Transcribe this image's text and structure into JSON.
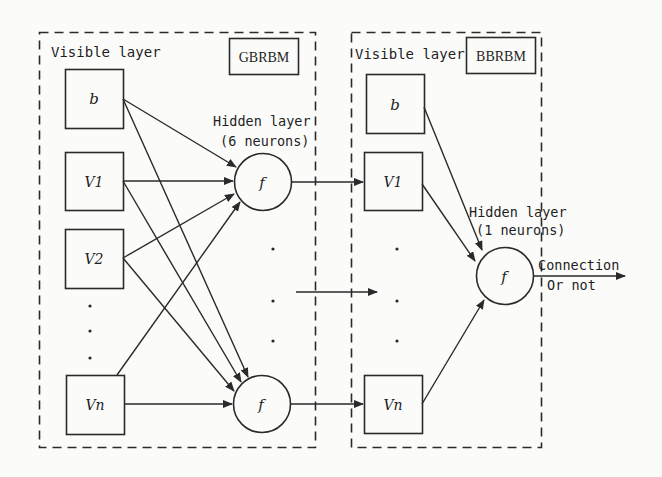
{
  "diagram": {
    "colors": {
      "stroke": "#2a2a2a",
      "background": "#fbfbfa",
      "text": "#1e1e1e"
    },
    "left_panel": {
      "visible_label": "Visible layer",
      "model_tag": "GBRBM",
      "hidden_label": "Hidden layer",
      "hidden_count": "(6 neurons)",
      "inputs": [
        {
          "id": "b",
          "label": "b"
        },
        {
          "id": "v1",
          "label": "V1"
        },
        {
          "id": "v2",
          "label": "V2"
        },
        {
          "id": "vn",
          "label": "Vn"
        }
      ],
      "hidden_nodes": [
        {
          "id": "f-top",
          "label": "f"
        },
        {
          "id": "f-bottom",
          "label": "f"
        }
      ],
      "ellipsis": "·"
    },
    "right_panel": {
      "visible_label": "Visible layer",
      "model_tag": "BBRBM",
      "hidden_label": "Hidden layer",
      "hidden_count": "(1 neurons)",
      "inputs": [
        {
          "id": "b",
          "label": "b"
        },
        {
          "id": "v1",
          "label": "V1"
        },
        {
          "id": "vn",
          "label": "Vn"
        }
      ],
      "hidden_nodes": [
        {
          "id": "f-out",
          "label": "f"
        }
      ]
    },
    "output": {
      "line1": "Connection",
      "line2": "Or not"
    }
  }
}
